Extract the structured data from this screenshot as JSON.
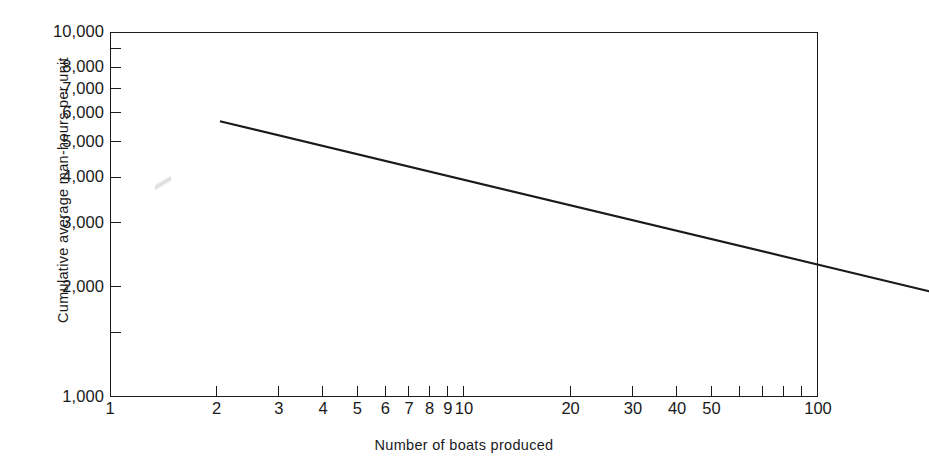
{
  "chart_data": {
    "type": "line",
    "title": "",
    "xlabel": "Number of boats produced",
    "ylabel": "Cumulative average man-hours per unit",
    "xscale": "log",
    "yscale": "log",
    "xlim": [
      1,
      100
    ],
    "ylim": [
      1000,
      10000
    ],
    "grid": false,
    "legend": null,
    "x_tick_labels": [
      "1",
      "2",
      "3",
      "4",
      "5",
      "6",
      "7",
      "8",
      "9",
      "10",
      "20",
      "30",
      "40",
      "50",
      "100"
    ],
    "x_tick_values": [
      1,
      2,
      3,
      4,
      5,
      6,
      7,
      8,
      9,
      10,
      20,
      30,
      40,
      50,
      100
    ],
    "x_minor_tick_values": [
      60,
      70,
      80,
      90
    ],
    "y_tick_labels": [
      "10,000",
      "8,000",
      "7,000",
      "6,000",
      "5,000",
      "4,000",
      "3,000",
      "2,000",
      "1,000"
    ],
    "y_tick_values": [
      10000,
      8000,
      7000,
      6000,
      5000,
      4000,
      3000,
      2000,
      1000
    ],
    "y_minor_tick_values": [
      9000,
      1500
    ],
    "series": [
      {
        "name": "Cumulative average man-hours per unit",
        "x": [
          1,
          2,
          3,
          4,
          5,
          6,
          7,
          8,
          9,
          10,
          20,
          30,
          40,
          50,
          60,
          70,
          80,
          90,
          100
        ],
        "values": [
          7000,
          6230,
          5810,
          5550,
          5350,
          5180,
          5050,
          4940,
          4840,
          4760,
          4240,
          3960,
          3770,
          3630,
          3520,
          3430,
          3360,
          3290,
          3240
        ],
        "color": "#1a1a1a"
      }
    ],
    "endpoints": {
      "start_x": 1,
      "start_y": 7000,
      "end_x": 100,
      "end_y": 2400
    }
  },
  "axes": {
    "y_title": "Cumulative average man-hours per unit",
    "x_title": "Number of boats produced",
    "y_ticks": [
      {
        "label": "10,000",
        "value": 10000
      },
      {
        "label": "8,000",
        "value": 8000
      },
      {
        "label": "7,000",
        "value": 7000
      },
      {
        "label": "6,000",
        "value": 6000
      },
      {
        "label": "5,000",
        "value": 5000
      },
      {
        "label": "4,000",
        "value": 4000
      },
      {
        "label": "3,000",
        "value": 3000
      },
      {
        "label": "2,000",
        "value": 2000
      },
      {
        "label": "1,000",
        "value": 1000
      }
    ],
    "x_ticks": [
      {
        "label": "1",
        "value": 1
      },
      {
        "label": "2",
        "value": 2
      },
      {
        "label": "3",
        "value": 3
      },
      {
        "label": "4",
        "value": 4
      },
      {
        "label": "5",
        "value": 5
      },
      {
        "label": "6",
        "value": 6
      },
      {
        "label": "7",
        "value": 7
      },
      {
        "label": "8",
        "value": 8
      },
      {
        "label": "9",
        "value": 9
      },
      {
        "label": "10",
        "value": 10
      },
      {
        "label": "20",
        "value": 20
      },
      {
        "label": "30",
        "value": 30
      },
      {
        "label": "40",
        "value": 40
      },
      {
        "label": "50",
        "value": 50
      },
      {
        "label": "100",
        "value": 100
      }
    ]
  },
  "colors": {
    "line": "#1a1a1a",
    "axis": "#1a1a1a",
    "background": "#ffffff",
    "text": "#1a1a1a"
  }
}
